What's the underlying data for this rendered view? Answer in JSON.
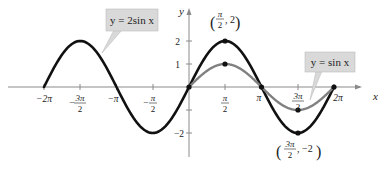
{
  "chart_data": {
    "type": "line",
    "title": "",
    "xlabel": "x",
    "ylabel": "y",
    "xlim": [
      -6.7,
      7.0
    ],
    "ylim": [
      -2.6,
      3.2
    ],
    "grid": false,
    "x_ticks": [
      "-2π",
      "-3π/2",
      "-π",
      "-π/2",
      "π/2",
      "π",
      "3π/2",
      "2π"
    ],
    "y_ticks": [
      "2",
      "1",
      "-1",
      "-2"
    ],
    "series": [
      {
        "name": "y = 2sin x",
        "function": "2*sin(x)",
        "domain": [
          "-2π",
          "2π"
        ],
        "color": "#111111",
        "key_points": [
          [
            0,
            0
          ],
          [
            1.5708,
            2
          ],
          [
            3.1416,
            0
          ],
          [
            4.7124,
            -2
          ],
          [
            6.2832,
            0
          ]
        ]
      },
      {
        "name": "y = sin x",
        "function": "sin(x)",
        "domain": [
          "0",
          "2π"
        ],
        "color": "#808080",
        "key_points": [
          [
            0,
            0
          ],
          [
            1.5708,
            1
          ],
          [
            3.1416,
            0
          ],
          [
            4.7124,
            -1
          ],
          [
            6.2832,
            0
          ]
        ]
      }
    ],
    "annotations": [
      "(π/2, 2)",
      "(3π/2, -2)"
    ],
    "legend_callouts": [
      {
        "text": "y = 2sin x",
        "points_to": "y = 2sin x curve"
      },
      {
        "text": "y = sin x",
        "points_to": "y = sin x curve"
      }
    ]
  },
  "labels": {
    "callout_2sin": "y = 2sin x",
    "callout_sin": "y = sin x",
    "axis_x": "x",
    "axis_y": "y",
    "point_max_num": "π",
    "point_max_den": "2",
    "point_max_y": ", 2",
    "point_min_num": "3π",
    "point_min_den": "2",
    "point_min_y": ", −2",
    "tick_neg2pi": "−2π",
    "tick_neg3pi_num": "3π",
    "tick_neg3pi_den": "2",
    "tick_negpi": "−π",
    "tick_negpi2_num": "π",
    "tick_negpi2_den": "2",
    "tick_pi2_num": "π",
    "tick_pi2_den": "2",
    "tick_pi": "π",
    "tick_3pi2_num": "3π",
    "tick_3pi2_den": "2",
    "tick_2pi": "2π",
    "y2": "2",
    "y1": "1",
    "yneg1": "−1",
    "yneg2": "−2"
  },
  "colors": {
    "curve_2sin": "#111111",
    "curve_sin": "#808080",
    "callout_bg": "#d9d9d9",
    "axis": "#8a8a8a"
  }
}
